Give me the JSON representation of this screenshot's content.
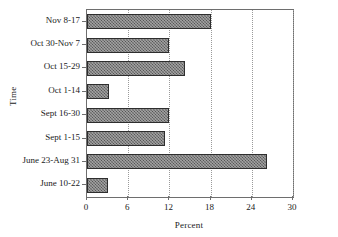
{
  "chart_data": {
    "type": "bar",
    "orientation": "horizontal",
    "title": "",
    "xlabel": "Percent",
    "ylabel": "Time",
    "xlim": [
      0,
      30
    ],
    "xticks": [
      0,
      6,
      12,
      18,
      24,
      30
    ],
    "xtick_labels": [
      "0",
      "6",
      "12",
      "18",
      "24",
      "30"
    ],
    "grid": "vertical-dotted",
    "legend": "none",
    "categories": [
      "Nov 8-17",
      "Oct 30-Nov 7",
      "Oct 15-29",
      "Oct 1-14",
      "Sept 16-30",
      "Sept 1-15",
      "June 23-Aug 31",
      "June 10-22"
    ],
    "values": [
      18.0,
      12.0,
      14.3,
      3.2,
      12.0,
      11.3,
      26.2,
      3.1
    ],
    "bar_color": "#545454",
    "bar_edge_color": "#2e2e2e",
    "bar_hatch": "crosshatch"
  }
}
